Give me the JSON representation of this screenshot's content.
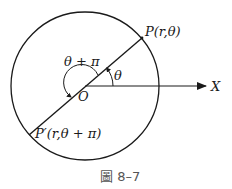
{
  "diagram": {
    "type": "polar-coordinate-figure",
    "labels": {
      "point_p": "P(r,θ)",
      "point_p_prime": "P′(r,θ + π)",
      "origin": "O",
      "axis": "X",
      "angle_theta": "θ",
      "angle_theta_pi": "θ + π"
    },
    "caption": "圖 8–7",
    "colors": {
      "stroke": "#1a1a1a",
      "background": "#ffffff",
      "caption": "#555555"
    }
  }
}
